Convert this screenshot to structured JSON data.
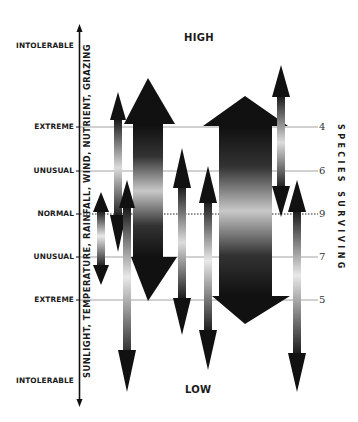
{
  "title_high": "HIGH",
  "title_low": "LOW",
  "left_axis": {
    "label": "SUNLIGHT, TEMPERATURE, RAINFALL, WIND, NUTRIENT, GRAZING",
    "levels": [
      {
        "label": "INTOLERABLE",
        "y": 46
      },
      {
        "label": "EXTREME",
        "y": 127
      },
      {
        "label": "UNUSUAL",
        "y": 171
      },
      {
        "label": "NORMAL",
        "y": 214
      },
      {
        "label": "UNUSUAL",
        "y": 257
      },
      {
        "label": "EXTREME",
        "y": 300
      },
      {
        "label": "INTOLERABLE",
        "y": 381
      }
    ]
  },
  "right_axis": {
    "label": "SPECIES SURVIVING",
    "values": [
      {
        "value": "4",
        "y": 127
      },
      {
        "value": "6",
        "y": 171
      },
      {
        "value": "9",
        "y": 214
      },
      {
        "value": "7",
        "y": 257
      },
      {
        "value": "5",
        "y": 300
      }
    ]
  },
  "colors": {
    "ink": "#111111",
    "gridline": "#888888"
  }
}
